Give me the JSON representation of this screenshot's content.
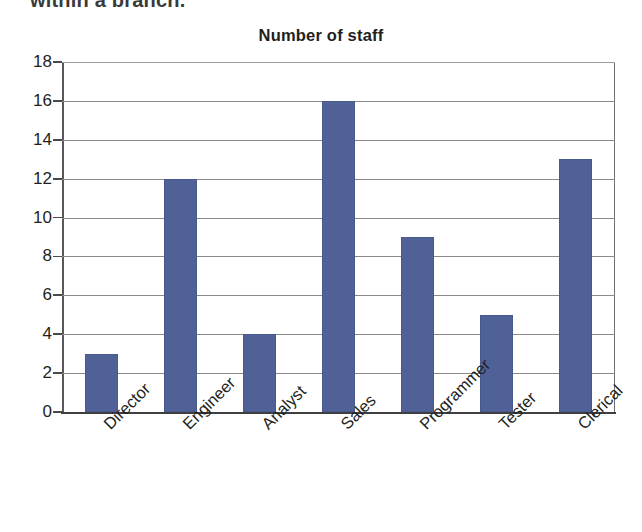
{
  "document": {
    "clipped_line": "within a branch."
  },
  "chart_data": {
    "type": "bar",
    "title": "Number of staff",
    "xlabel": "",
    "ylabel": "",
    "categories": [
      "Director",
      "Engineer",
      "Analyst",
      "Sales",
      "Programmer",
      "Tester",
      "Clerical"
    ],
    "values": [
      3,
      12,
      4,
      16,
      9,
      5,
      13
    ],
    "ylim": [
      0,
      18
    ],
    "ytick_step": 2,
    "yticks": [
      0,
      2,
      4,
      6,
      8,
      10,
      12,
      14,
      16,
      18
    ],
    "ytick_labels": [
      "0",
      "2",
      "4",
      "6",
      "8",
      "10",
      "12",
      "14",
      "16",
      "18"
    ],
    "grid": true,
    "grid_axis": "y",
    "legend": false,
    "legend_position": "none",
    "bar_color": "#4f6196",
    "gridline_color": "#8a8a8c",
    "axis_color": "#3f3f41",
    "xlabel_rotation": -45,
    "background": "#ffffff"
  }
}
